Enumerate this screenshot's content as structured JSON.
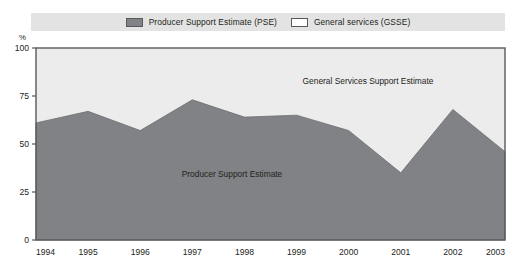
{
  "legend": {
    "items": [
      {
        "label": "Producer Support Estimate (PSE)",
        "swatch": "dark-gray-swatch",
        "color": "#808285"
      },
      {
        "label": "General services (GSSE)",
        "swatch": "white-swatch",
        "color": "#ffffff"
      }
    ]
  },
  "axis": {
    "unit_label": "%",
    "y_ticks": [
      "100",
      "75",
      "50",
      "25",
      "0"
    ],
    "x_ticks": [
      "1994",
      "1995",
      "1996",
      "1997",
      "1998",
      "1999",
      "2000",
      "2001",
      "2002",
      "2003"
    ]
  },
  "annotations": {
    "upper_area": "General Services Support Estimate",
    "lower_area": "Producer Support Estimate"
  },
  "colors": {
    "pse_fill": "#808285",
    "gsse_fill": "#ececec",
    "legend_bar_bg": "#e3e3e3",
    "frame": "#58595b",
    "text": "#231f20"
  },
  "chart_data": {
    "type": "area",
    "title": "",
    "subtitle": "",
    "xlabel": "",
    "ylabel": "%",
    "ylim": [
      0,
      100
    ],
    "xlim": [
      "1994",
      "2003"
    ],
    "grid": false,
    "stacked": true,
    "legend_position": "top",
    "x": [
      "1994",
      "1995",
      "1996",
      "1997",
      "1998",
      "1999",
      "2000",
      "2001",
      "2002",
      "2003"
    ],
    "yticks": [
      0,
      25,
      50,
      75,
      100
    ],
    "series": [
      {
        "name": "Producer Support Estimate (PSE)",
        "color": "#808285",
        "values": [
          61,
          67,
          57,
          73,
          64,
          65,
          57,
          35,
          68,
          46
        ]
      },
      {
        "name": "General services (GSSE)",
        "color": "#ececec",
        "values": [
          39,
          33,
          43,
          27,
          36,
          35,
          43,
          65,
          32,
          54
        ]
      }
    ],
    "annotations": [
      {
        "text": "General Services Support Estimate",
        "x": "1999",
        "y": 88
      },
      {
        "text": "Producer Support Estimate",
        "x": "1996.7",
        "y": 33
      }
    ]
  }
}
